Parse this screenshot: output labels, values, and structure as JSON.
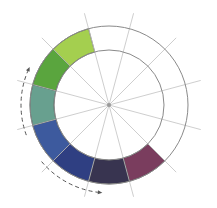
{
  "diagram": {
    "type": "color-wheel",
    "center": [
      109,
      105
    ],
    "outer_radius": 79,
    "inner_radius": 55,
    "spoke_length": 95,
    "segment_count": 12,
    "first_boundary_deg": 15,
    "ring_stroke": "#8a8a8a",
    "spoke_stroke": "#c2c2c2",
    "segment_border": "#3a3a3a",
    "center_dot": "#9a9a9a",
    "segments": [
      {
        "name": "plum",
        "start_deg": 45,
        "end_deg": 75,
        "color": "#7a3d5e"
      },
      {
        "name": "dark-violet",
        "start_deg": 75,
        "end_deg": 105,
        "color": "#383450"
      },
      {
        "name": "dark-blue",
        "start_deg": 105,
        "end_deg": 135,
        "color": "#2f3f82"
      },
      {
        "name": "blue",
        "start_deg": 135,
        "end_deg": 165,
        "color": "#3d5a9e"
      },
      {
        "name": "teal",
        "start_deg": 165,
        "end_deg": 195,
        "color": "#68a08f"
      },
      {
        "name": "green",
        "start_deg": 195,
        "end_deg": 225,
        "color": "#5aa53e"
      },
      {
        "name": "light-green",
        "start_deg": 225,
        "end_deg": 255,
        "color": "#a4cf4f"
      }
    ],
    "arrows": [
      {
        "name": "left-arrow",
        "radius": 88,
        "from_deg": 160,
        "to_deg": 205,
        "direction": "counterclockwise-up",
        "color": "#555555"
      },
      {
        "name": "bottom-arrow",
        "radius": 88,
        "from_deg": 140,
        "to_deg": 95,
        "direction": "toward-bottom-right",
        "color": "#555555"
      }
    ]
  }
}
